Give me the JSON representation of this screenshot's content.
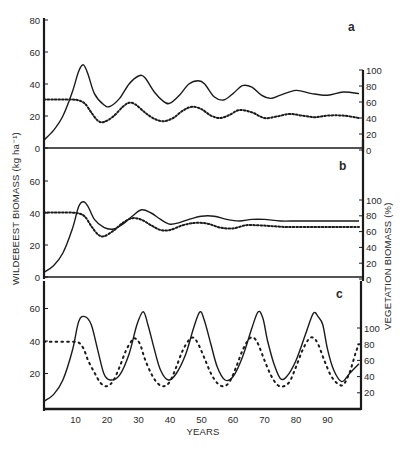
{
  "chart_data": [
    {
      "panel": "a",
      "type": "line",
      "title": "a",
      "xlabel": "YEARS",
      "ylabel_left": "WILDEBEEST BIOMASS (kg ha⁻¹)",
      "ylabel_right": "VEGETATION BIOMASS (%)",
      "xlim": [
        0,
        100
      ],
      "ylim_left": [
        0,
        80
      ],
      "ylim_right": [
        0,
        100
      ],
      "left_ticks": [
        0,
        20,
        40,
        60,
        80
      ],
      "right_ticks": [
        0,
        20,
        40,
        60,
        80,
        100
      ],
      "series": [
        {
          "name": "Wildebeest biomass",
          "style": "solid",
          "axis": "left",
          "x": [
            0,
            3,
            6,
            9,
            11,
            12.5,
            14,
            16,
            19,
            21,
            24,
            27,
            30,
            32,
            35,
            38,
            40,
            43,
            46,
            49,
            51,
            54,
            57,
            60,
            63,
            66,
            69,
            72,
            75,
            80,
            85,
            90,
            95,
            100
          ],
          "y": [
            5,
            11,
            20,
            35,
            48,
            52,
            46,
            34,
            27,
            26,
            31,
            40,
            45,
            44,
            35,
            29,
            28,
            33,
            40,
            42,
            40,
            32,
            30,
            34,
            39,
            38,
            33,
            31,
            33,
            36,
            34,
            33,
            35,
            34
          ]
        },
        {
          "name": "Vegetation biomass",
          "style": "dotted",
          "axis": "right",
          "x": [
            0,
            3,
            6,
            9,
            11,
            13,
            15,
            17,
            19,
            22,
            25,
            27,
            29,
            32,
            35,
            38,
            41,
            44,
            47,
            50,
            53,
            56,
            59,
            62,
            66,
            70,
            74,
            78,
            82,
            86,
            90,
            95,
            100
          ],
          "y": [
            63,
            63,
            63,
            63,
            62,
            58,
            47,
            37,
            35,
            42,
            54,
            59,
            57,
            47,
            39,
            36,
            40,
            49,
            54,
            51,
            43,
            40,
            44,
            50,
            47,
            40,
            42,
            45,
            43,
            41,
            43,
            43,
            40
          ]
        }
      ],
      "annotations": [
        "a"
      ]
    },
    {
      "panel": "b",
      "type": "line",
      "title": "b",
      "xlim": [
        0,
        100
      ],
      "ylim_left": [
        0,
        60
      ],
      "ylim_right": [
        0,
        100
      ],
      "left_ticks": [
        0,
        20,
        40,
        60
      ],
      "right_ticks": [
        0,
        20,
        40,
        60,
        80,
        100
      ],
      "series": [
        {
          "name": "Wildebeest biomass",
          "style": "solid",
          "axis": "left",
          "x": [
            0,
            3,
            6,
            9,
            11,
            12.5,
            14,
            16,
            19,
            22,
            25,
            28,
            31,
            34,
            37,
            40,
            43,
            46,
            50,
            54,
            58,
            62,
            66,
            70,
            75,
            80,
            85,
            90,
            95,
            100
          ],
          "y": [
            3,
            7,
            15,
            30,
            44,
            47,
            44,
            36,
            31,
            30,
            33,
            38,
            42,
            40,
            36,
            33,
            34,
            36,
            38,
            38,
            36,
            35,
            36,
            36,
            35,
            35,
            35,
            35,
            35,
            35
          ]
        },
        {
          "name": "Vegetation biomass",
          "style": "dotted",
          "axis": "right",
          "x": [
            0,
            3,
            6,
            9,
            11,
            13,
            15,
            17,
            19,
            22,
            25,
            28,
            31,
            34,
            37,
            40,
            44,
            48,
            52,
            56,
            60,
            64,
            68,
            72,
            76,
            80,
            85,
            90,
            95,
            100
          ],
          "y": [
            84,
            84,
            84,
            84,
            83,
            79,
            67,
            57,
            54,
            61,
            71,
            77,
            75,
            68,
            62,
            62,
            68,
            71,
            70,
            65,
            64,
            68,
            68,
            67,
            66,
            66,
            66,
            66,
            66,
            66
          ]
        }
      ],
      "annotations": [
        "b"
      ]
    },
    {
      "panel": "c",
      "type": "line",
      "title": "c",
      "xlim": [
        0,
        100
      ],
      "ylim_left": [
        0,
        60
      ],
      "ylim_right": [
        0,
        100
      ],
      "left_ticks": [
        20,
        40,
        60
      ],
      "right_ticks": [
        20,
        40,
        60,
        80,
        100
      ],
      "x_ticks": [
        10,
        20,
        30,
        40,
        50,
        60,
        70,
        80,
        90
      ],
      "series": [
        {
          "name": "Wildebeest biomass",
          "style": "solid",
          "axis": "left",
          "x": [
            0,
            3,
            6,
            9,
            11,
            13,
            15,
            17,
            19,
            21,
            24,
            27,
            29.5,
            31.5,
            33,
            35,
            37,
            39.5,
            42,
            45,
            47.5,
            49.5,
            51,
            53,
            55,
            57.5,
            60,
            63,
            66,
            68,
            69.5,
            71,
            73,
            75,
            77,
            80,
            83,
            85.5,
            87,
            88.5,
            90,
            92,
            94.5,
            97,
            100
          ],
          "y": [
            3,
            7,
            16,
            34,
            52,
            55,
            50,
            35,
            20,
            16,
            19,
            32,
            50,
            58,
            50,
            35,
            22,
            16,
            20,
            32,
            48,
            58,
            52,
            38,
            24,
            16,
            18,
            30,
            48,
            58,
            54,
            40,
            26,
            17,
            18,
            28,
            44,
            57,
            55,
            50,
            35,
            22,
            15,
            20,
            26
          ]
        },
        {
          "name": "Vegetation biomass",
          "style": "dotted",
          "axis": "right",
          "x": [
            0,
            3,
            6,
            9,
            11,
            12.5,
            14,
            16,
            18,
            20,
            22,
            24,
            26,
            28,
            29,
            30.5,
            32,
            34,
            36,
            38,
            40,
            42,
            44,
            46,
            47.5,
            49,
            51,
            53,
            55,
            57,
            59,
            61,
            63,
            65,
            66.5,
            68,
            70,
            72,
            74,
            76,
            78,
            80,
            82,
            84,
            85.5,
            87,
            89,
            91,
            93,
            95,
            97,
            99,
            100
          ],
          "y": [
            83,
            83,
            83,
            83,
            82,
            75,
            60,
            45,
            32,
            28,
            35,
            52,
            72,
            85,
            87,
            80,
            62,
            44,
            32,
            28,
            34,
            52,
            72,
            85,
            88,
            80,
            62,
            44,
            32,
            28,
            34,
            52,
            72,
            86,
            88,
            80,
            60,
            42,
            30,
            28,
            34,
            52,
            72,
            86,
            88,
            80,
            60,
            42,
            32,
            30,
            45,
            70,
            80
          ]
        }
      ],
      "annotations": [
        "c"
      ]
    }
  ],
  "figure": {
    "ylabel_left": "WILDEBEEST BIOMASS (kg ha⁻¹)",
    "ylabel_right": "VEGETATION BIOMASS (%)",
    "xlabel": "YEARS",
    "panel_labels": [
      "a",
      "b",
      "c"
    ],
    "x_tick_labels": [
      "10",
      "20",
      "30",
      "40",
      "50",
      "60",
      "70",
      "80",
      "90"
    ],
    "colors": {
      "ink": "#1a1a1a",
      "background": "#ffffff"
    }
  }
}
